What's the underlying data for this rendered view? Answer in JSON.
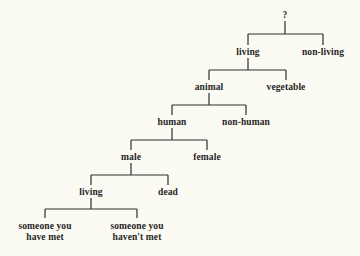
{
  "diagram": {
    "type": "tree",
    "colors": {
      "background": "#fbfbf4",
      "text": "#262626",
      "lines": "#2e2e2e"
    },
    "nodes": {
      "root": {
        "label": "?",
        "x": 285,
        "y": 15
      },
      "living": {
        "label": "living",
        "x": 248,
        "y": 52
      },
      "non_living": {
        "label": "non-living",
        "x": 323,
        "y": 52
      },
      "animal": {
        "label": "animal",
        "x": 209,
        "y": 87
      },
      "vegetable": {
        "label": "vegetable",
        "x": 286,
        "y": 87
      },
      "human": {
        "label": "human",
        "x": 172,
        "y": 122
      },
      "non_human": {
        "label": "non-human",
        "x": 246,
        "y": 122
      },
      "male": {
        "label": "male",
        "x": 131,
        "y": 157
      },
      "female": {
        "label": "female",
        "x": 207,
        "y": 157
      },
      "living2": {
        "label": "living",
        "x": 91,
        "y": 192
      },
      "dead": {
        "label": "dead",
        "x": 168,
        "y": 192
      },
      "met": {
        "label": "someone you\nhave met",
        "x": 45,
        "y": 232
      },
      "not_met": {
        "label": "someone you\nhaven't met",
        "x": 137,
        "y": 232
      }
    },
    "edges": [
      {
        "parent": "root",
        "children": [
          "living",
          "non_living"
        ]
      },
      {
        "parent": "living",
        "children": [
          "animal",
          "vegetable"
        ]
      },
      {
        "parent": "animal",
        "children": [
          "human",
          "non_human"
        ]
      },
      {
        "parent": "human",
        "children": [
          "male",
          "female"
        ]
      },
      {
        "parent": "male",
        "children": [
          "living2",
          "dead"
        ]
      },
      {
        "parent": "living2",
        "children": [
          "met",
          "not_met"
        ]
      }
    ]
  }
}
